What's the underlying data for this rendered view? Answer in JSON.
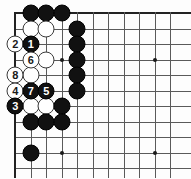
{
  "diagram": {
    "kind": "go-board-diagram",
    "board_size": 19,
    "visible_columns": 11,
    "visible_rows": 11,
    "corner_shown": "top-left",
    "colors": {
      "black_stone": "#111111",
      "white_stone": "#ffffff",
      "grid_line": "#5a5a5a",
      "board_edge": "#222222",
      "background": "#fdfdfd",
      "star_point": "#1a1a1a"
    },
    "geometry": {
      "origin_x": 15,
      "origin_y": 13,
      "spacing": 15.5,
      "stone_diameter": 17
    },
    "star_points": [
      {
        "col": 4,
        "row": 4
      },
      {
        "col": 10,
        "row": 4
      },
      {
        "col": 4,
        "row": 10
      },
      {
        "col": 10,
        "row": 10
      }
    ],
    "stones": [
      {
        "col": 2,
        "row": 1,
        "color": "black",
        "label": ""
      },
      {
        "col": 3,
        "row": 1,
        "color": "black",
        "label": ""
      },
      {
        "col": 4,
        "row": 1,
        "color": "black",
        "label": ""
      },
      {
        "col": 2,
        "row": 2,
        "color": "white",
        "label": ""
      },
      {
        "col": 3,
        "row": 2,
        "color": "white",
        "label": ""
      },
      {
        "col": 5,
        "row": 2,
        "color": "black",
        "label": ""
      },
      {
        "col": 1,
        "row": 3,
        "color": "white",
        "label": "2"
      },
      {
        "col": 2,
        "row": 3,
        "color": "black",
        "label": "1"
      },
      {
        "col": 5,
        "row": 3,
        "color": "black",
        "label": ""
      },
      {
        "col": 2,
        "row": 4,
        "color": "white",
        "label": "6"
      },
      {
        "col": 3,
        "row": 4,
        "color": "white",
        "label": ""
      },
      {
        "col": 5,
        "row": 4,
        "color": "black",
        "label": ""
      },
      {
        "col": 1,
        "row": 5,
        "color": "white",
        "label": "8"
      },
      {
        "col": 2,
        "row": 5,
        "color": "white",
        "label": ""
      },
      {
        "col": 5,
        "row": 5,
        "color": "black",
        "label": ""
      },
      {
        "col": 1,
        "row": 6,
        "color": "white",
        "label": "4"
      },
      {
        "col": 2,
        "row": 6,
        "color": "black",
        "label": "7"
      },
      {
        "col": 3,
        "row": 6,
        "color": "black",
        "label": "5"
      },
      {
        "col": 5,
        "row": 6,
        "color": "black",
        "label": ""
      },
      {
        "col": 1,
        "row": 7,
        "color": "black",
        "label": "3"
      },
      {
        "col": 2,
        "row": 7,
        "color": "white",
        "label": ""
      },
      {
        "col": 3,
        "row": 7,
        "color": "white",
        "label": ""
      },
      {
        "col": 4,
        "row": 7,
        "color": "black",
        "label": ""
      },
      {
        "col": 2,
        "row": 8,
        "color": "black",
        "label": ""
      },
      {
        "col": 3,
        "row": 8,
        "color": "black",
        "label": ""
      },
      {
        "col": 4,
        "row": 8,
        "color": "black",
        "label": ""
      },
      {
        "col": 2,
        "row": 10,
        "color": "black",
        "label": ""
      }
    ],
    "move_sequence": [
      {
        "move": 1,
        "color": "black",
        "col": 2,
        "row": 3
      },
      {
        "move": 2,
        "color": "white",
        "col": 1,
        "row": 3
      },
      {
        "move": 3,
        "color": "black",
        "col": 1,
        "row": 7
      },
      {
        "move": 4,
        "color": "white",
        "col": 1,
        "row": 6
      },
      {
        "move": 5,
        "color": "black",
        "col": 3,
        "row": 6
      },
      {
        "move": 6,
        "color": "white",
        "col": 2,
        "row": 4
      },
      {
        "move": 7,
        "color": "black",
        "col": 2,
        "row": 6
      },
      {
        "move": 8,
        "color": "white",
        "col": 1,
        "row": 5
      }
    ]
  }
}
